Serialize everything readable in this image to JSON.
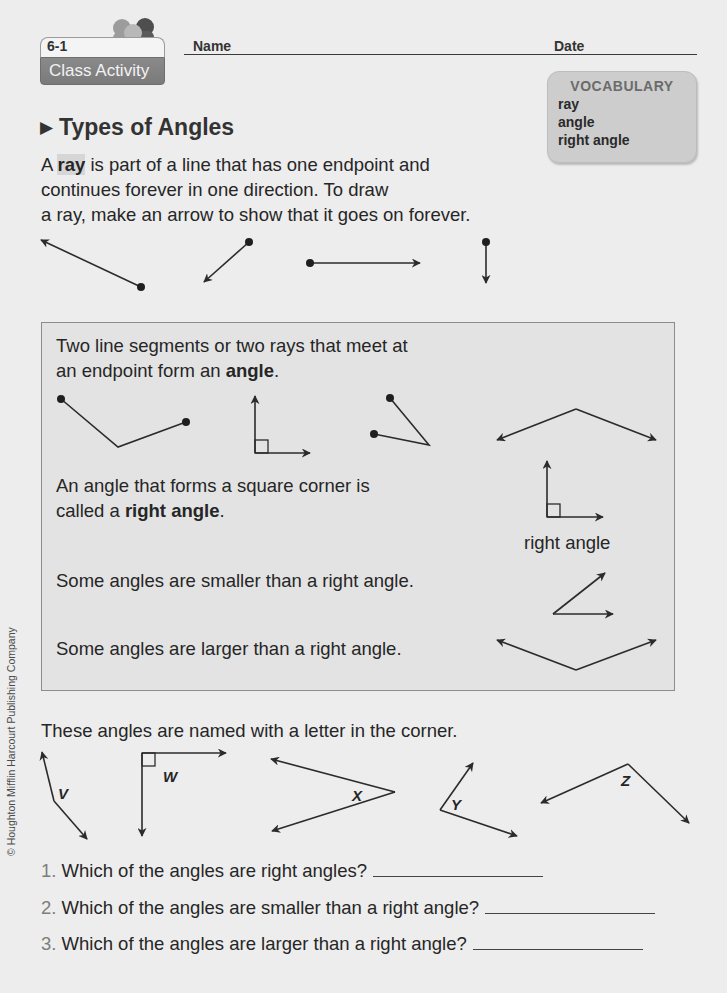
{
  "header": {
    "lesson_number": "6-1",
    "badge_label": "Class Activity",
    "name_label": "Name",
    "date_label": "Date",
    "badge_icon": "people-icon"
  },
  "vocabulary": {
    "title": "VOCABULARY",
    "items": [
      "ray",
      "angle",
      "right angle"
    ]
  },
  "section": {
    "title": "Types of Angles",
    "title_icon": "triangle-bullet-icon"
  },
  "intro": {
    "part1": "A ",
    "term": "ray",
    "part2": " is part of a line that has one endpoint and",
    "line2": "continues forever in one direction. To draw",
    "line3": "a ray, make an arrow to show that it goes on forever."
  },
  "box": {
    "angle_def_line1": "Two line segments or two rays that meet at",
    "angle_def_line2_pre": "an endpoint form an ",
    "angle_def_term": "angle",
    "angle_def_line2_post": ".",
    "right_def_line1": "An angle that forms a square corner is",
    "right_def_line2_pre": "called a ",
    "right_def_term": "right angle",
    "right_def_line2_post": ".",
    "right_angle_caption": "right angle",
    "smaller_text": "Some angles are smaller than a right angle.",
    "larger_text": "Some angles are larger than a right angle."
  },
  "named_angles": {
    "intro": "These angles are named with a letter in the corner.",
    "labels": [
      "V",
      "W",
      "X",
      "Y",
      "Z"
    ]
  },
  "questions": [
    {
      "number": "1.",
      "text": "Which of the angles are right angles?",
      "answer": ""
    },
    {
      "number": "2.",
      "text": "Which of the angles are smaller than a right angle?",
      "answer": ""
    },
    {
      "number": "3.",
      "text": "Which of the angles are larger than a right angle?",
      "answer": ""
    }
  ],
  "footer": {
    "copyright": "© Houghton Mifflin Harcourt Publishing Company"
  }
}
